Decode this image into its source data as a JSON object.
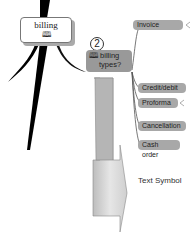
{
  "root": {
    "label": "billing",
    "icon": "book-icon"
  },
  "topic": {
    "number": "2",
    "line1": "billing",
    "line2": "types?",
    "icon": "book-icon"
  },
  "leaves": [
    {
      "label": "Invoice",
      "x": 133,
      "y": 20,
      "w": 50
    },
    {
      "label": "Credit/debit",
      "x": 138,
      "y": 83,
      "w": 48
    },
    {
      "label": "Proforma",
      "x": 138,
      "y": 98,
      "w": 40
    },
    {
      "label": "Cancellation",
      "x": 138,
      "y": 121,
      "w": 48
    },
    {
      "label": "Cash order",
      "x": 138,
      "y": 140,
      "w": 42
    }
  ],
  "arrow_label": "Text Symbol",
  "colors": {
    "node": "#a8a8a8",
    "line": "#555555",
    "arrow": "#c8c8c8"
  }
}
